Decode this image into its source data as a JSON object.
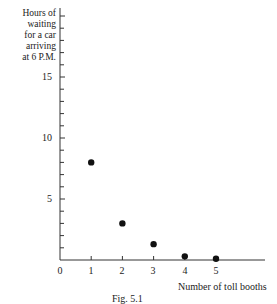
{
  "chart_data": {
    "type": "scatter",
    "title": "",
    "caption": "Fig. 5.1",
    "xlabel": "Number of toll booths",
    "ylabel": "Hours of waiting for a car arriving at 6 P.M.",
    "ylabel_lines": [
      "Hours of",
      "waiting",
      "for a car",
      "arriving",
      "at 6 P.M."
    ],
    "x": [
      1,
      2,
      3,
      4,
      5
    ],
    "y": [
      8,
      3,
      1.3,
      0.3,
      0.1
    ],
    "xticks": [
      "0",
      "1",
      "2",
      "3",
      "4",
      "5"
    ],
    "yticks": [
      "5",
      "10",
      "15"
    ],
    "xlim": [
      0,
      6
    ],
    "ylim": [
      0,
      20
    ],
    "grid": false,
    "legend": null
  }
}
